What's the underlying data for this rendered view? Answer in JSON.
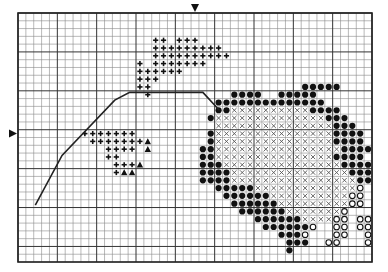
{
  "grid": {
    "columns": 45,
    "rows": 32,
    "major_every": 10
  },
  "center_markers": {
    "top_column": 22,
    "left_row": 15
  },
  "legend_symbols": {
    "+": "plus",
    "^": "filled-triangle",
    "o": "filled-circle",
    "x": "cross",
    "c": "open-circle"
  },
  "colors": {
    "ink": "#111111",
    "grid_minor": "#8a8a8a",
    "grid_major": "#333333",
    "background": "#ffffff"
  },
  "pattern_rows": [
    ".............................................",
    ".............................................",
    ".............................................",
    ".................++.+++......................",
    ".................+++++++++...................",
    ".................++++++++++..................",
    "...............+.+++++++.....................",
    "...............++++++........................",
    "...............+++...........................",
    "...............++...................ooooo....",
    "................+..........oooo..ooooo.......",
    ".........................oooooooooooooo......",
    ".........................ooxxxxxxxxxxoooo....",
    "........................oxxxxxxxxxxxxxxooo...",
    ".........................xxxxxxxxxxxxxxxooo..",
    "........+++++++.........oxxxxxxxxxxxxxxxoooo.",
    ".........+++++++^.......oxxxxxxxxxxxxxxxoooo.",
    "...........++++.^......ooxxxxxxxxxxxxxxxxoooo",
    "...........++..........ooxxxxxxxxxxxxxxxoooo.",
    "............+++^.......oooxxxxxxxxxxxxxxxoooo",
    "............+^^........ooooxxxxxxxxxxxxxxxoooo",
    ".......................ooooxxxxxxxxxxxxxxxxooo",
    ".........................oooooxxxxxxxxxxxxxc..",
    "..........................ooooooxxxxxxxxxxcc..",
    "...........................ooooooxxxxxxxxxcc..",
    "............................ooooooxxxxxxxc....",
    "..............................ooooooxxxxcc.cc.",
    "...............................ooooooc..cc.cc.",
    ".................................oooc...cc..cc",
    "..................................ooo..cc...cc",
    "..................................o...........",
    "............................................."
  ],
  "outline_path": [
    [
      2.2,
      24.7
    ],
    [
      5.6,
      18.3
    ],
    [
      12.3,
      11.2
    ],
    [
      14.2,
      10.2
    ],
    [
      23.5,
      10.2
    ],
    [
      25.6,
      12.5
    ]
  ]
}
